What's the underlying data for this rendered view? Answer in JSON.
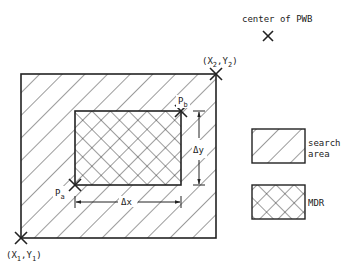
{
  "diagram": {
    "center_label": "center of PWB",
    "corner_bottom_left": {
      "x": "X",
      "xs": "1",
      "y": "Y",
      "ys": "1"
    },
    "corner_top_right": {
      "x": "X",
      "xs": "2",
      "y": "Y",
      "ys": "2"
    },
    "point_a": {
      "p": "P",
      "s": "a"
    },
    "point_b": {
      "p": "P",
      "s": "b"
    },
    "dx_label": "Δx",
    "dy_label": "Δy",
    "legend": [
      {
        "label_line1": "search",
        "label_line2": "area",
        "pattern": "diagonal-hatch"
      },
      {
        "label": "MDR",
        "pattern": "cross-hatch"
      }
    ],
    "line_color": "#222222"
  }
}
